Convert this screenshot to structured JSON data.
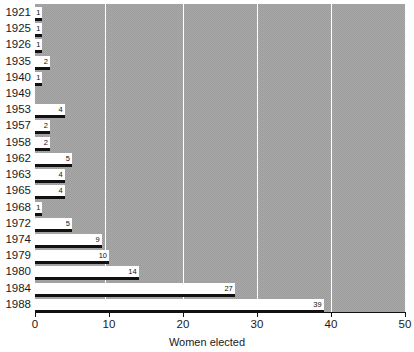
{
  "chart_data": {
    "type": "bar",
    "orientation": "horizontal",
    "title": "",
    "xlabel": "Women elected",
    "ylabel": "",
    "xlim": [
      0,
      50
    ],
    "xticks": [
      0,
      10,
      20,
      30,
      40,
      50
    ],
    "xtick_labels": [
      "0",
      "10",
      "20",
      "30",
      "40",
      "50"
    ],
    "grid": true,
    "grid_axis": "x",
    "legend": false,
    "categories": [
      "1921",
      "1925",
      "1926",
      "1935",
      "1940",
      "1949",
      "1953",
      "1957",
      "1958",
      "1962",
      "1963",
      "1965",
      "1968",
      "1972",
      "1974",
      "1979",
      "1980",
      "1984",
      "1988"
    ],
    "values": [
      1,
      1,
      1,
      2,
      1,
      0,
      4,
      2,
      2,
      5,
      4,
      4,
      1,
      5,
      9,
      10,
      14,
      27,
      39
    ],
    "value_labels": [
      "1",
      "1",
      "1",
      "2",
      "1",
      "",
      "4",
      "2",
      "2",
      "5",
      "4",
      "4",
      "1",
      "5",
      "9",
      "10",
      "14",
      "27",
      "39"
    ],
    "colors": {
      "plot_background": "#a9a9a9",
      "bar_fill": "#ffffff",
      "bar_edge": "#111111",
      "gridline": "#ffffff",
      "axis": "#111111",
      "text": "#1a1a1a"
    }
  }
}
